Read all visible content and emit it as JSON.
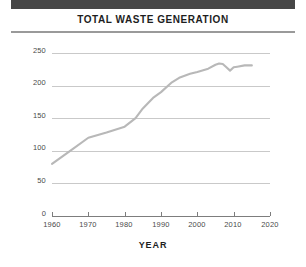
{
  "header": {
    "top_bar_color": "#474747",
    "rule_color": "#9a9a9a"
  },
  "chart_data": {
    "type": "line",
    "title": "TOTAL WASTE GENERATION",
    "xlabel": "YEAR",
    "ylabel": "MILLIONS OF METRIC TONS",
    "xlim": [
      1960,
      2020
    ],
    "ylim": [
      0,
      250
    ],
    "grid": true,
    "legend": "none",
    "line_color": "#b8b8b8",
    "x_ticks": [
      "1960",
      "1970",
      "1980",
      "1990",
      "2000",
      "2010",
      "2020"
    ],
    "y_ticks": [
      "0",
      "50",
      "100",
      "150",
      "200",
      "250"
    ],
    "x": [
      1960,
      1965,
      1970,
      1975,
      1980,
      1983,
      1985,
      1988,
      1990,
      1993,
      1995,
      1998,
      2000,
      2003,
      2005,
      2006,
      2007,
      2008,
      2009,
      2010,
      2011,
      2013,
      2015
    ],
    "values": [
      80,
      100,
      120,
      128,
      137,
      150,
      165,
      182,
      190,
      205,
      212,
      218,
      221,
      226,
      232,
      234,
      233,
      228,
      223,
      228,
      229,
      231,
      231
    ],
    "series": [
      {
        "name": "Total waste generation",
        "values": [
          80,
          100,
          120,
          128,
          137,
          150,
          165,
          182,
          190,
          205,
          212,
          218,
          221,
          226,
          232,
          234,
          233,
          228,
          223,
          228,
          229,
          231,
          231
        ]
      }
    ]
  }
}
